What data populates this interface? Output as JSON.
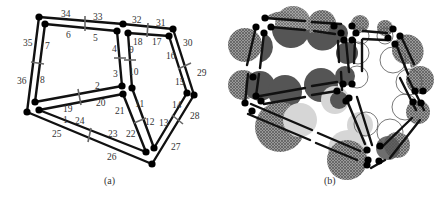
{
  "figure": {
    "panels": [
      {
        "id": "a",
        "caption": "(a)"
      },
      {
        "id": "b",
        "caption": "(b)"
      }
    ],
    "panel_a": {
      "edge_labels": [
        {
          "text": "1"
        },
        {
          "text": "2"
        },
        {
          "text": "3"
        },
        {
          "text": "4"
        },
        {
          "text": "5"
        },
        {
          "text": "6"
        },
        {
          "text": "7"
        },
        {
          "text": "8"
        },
        {
          "text": "9"
        },
        {
          "text": "10"
        },
        {
          "text": "11"
        },
        {
          "text": "12"
        },
        {
          "text": "13"
        },
        {
          "text": "14"
        },
        {
          "text": "15"
        },
        {
          "text": "16"
        },
        {
          "text": "17"
        },
        {
          "text": "18"
        },
        {
          "text": "19"
        },
        {
          "text": "20"
        },
        {
          "text": "21"
        },
        {
          "text": "22"
        },
        {
          "text": "23"
        },
        {
          "text": "24"
        },
        {
          "text": "25"
        },
        {
          "text": "26"
        },
        {
          "text": "27"
        },
        {
          "text": "28"
        },
        {
          "text": "29"
        },
        {
          "text": "30"
        },
        {
          "text": "31"
        },
        {
          "text": "32"
        },
        {
          "text": "33"
        },
        {
          "text": "34"
        },
        {
          "text": "35"
        },
        {
          "text": "36"
        }
      ]
    },
    "colors": {
      "edge": "#111111",
      "node": "#000000",
      "dark_disc": "#555555",
      "light_disc": "#d6d6d6",
      "hatch": "#777777"
    }
  }
}
